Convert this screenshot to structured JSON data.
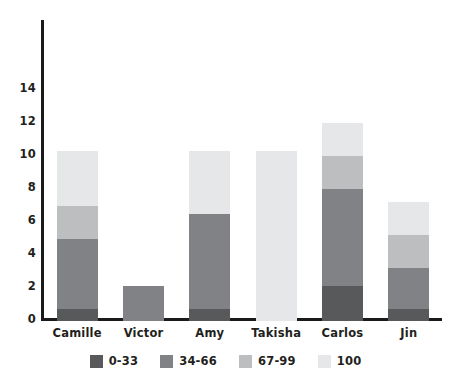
{
  "chart_data": {
    "type": "bar",
    "title": "",
    "subtitle": "",
    "xlabel": "",
    "ylabel": "",
    "stacked": true,
    "orientation": "vertical",
    "grid": false,
    "ylim": [
      0,
      15
    ],
    "ytick_labels": [
      "0",
      "2",
      "4",
      "6",
      "8",
      "10",
      "12",
      "14"
    ],
    "ytick_values": [
      0,
      2,
      4,
      6,
      8,
      10,
      12,
      14
    ],
    "legend_position": "bottom",
    "categories": [
      "Camille",
      "Victor",
      "Amy",
      "Takisha",
      "Carlos",
      "Jin"
    ],
    "series": [
      {
        "name": "0-33",
        "color": "#58595b",
        "values": [
          0.7,
          0,
          0.7,
          0,
          2.1,
          0.7
        ]
      },
      {
        "name": "34-66",
        "color": "#808285",
        "values": [
          4.3,
          2.1,
          5.8,
          0,
          5.9,
          2.5
        ]
      },
      {
        "name": "67-99",
        "color": "#bcbec0",
        "values": [
          2.0,
          0,
          0,
          0,
          2.0,
          2.0
        ]
      },
      {
        "name": "100",
        "color": "#e6e7e8",
        "values": [
          3.3,
          0,
          3.8,
          10.3,
          2.0,
          2.0
        ]
      }
    ],
    "totals": [
      10.3,
      2.1,
      10.3,
      10.3,
      12.0,
      7.2
    ],
    "axis_color": "#1a1a1a",
    "text_color": "#231f20",
    "background": "#ffffff"
  }
}
